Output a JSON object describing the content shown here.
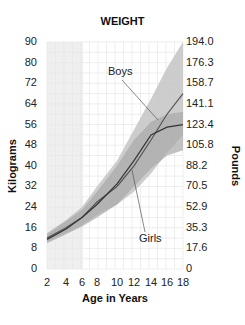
{
  "chart_data": {
    "type": "line",
    "title": "WEIGHT",
    "xlabel": "Age in Years",
    "ylabel": "Kilograms",
    "ylabel_right": "Pounds",
    "x": [
      2,
      4,
      6,
      8,
      10,
      12,
      14,
      16,
      18
    ],
    "x_tick_labels": [
      "2",
      "4",
      "6",
      "8",
      "10",
      "12",
      "14",
      "16",
      "18"
    ],
    "y_tick_labels": [
      "90",
      "80",
      "72",
      "64",
      "56",
      "48",
      "40",
      "32",
      "24",
      "16",
      "8",
      "0"
    ],
    "y_right_tick_labels": [
      "194.0",
      "176.3",
      "158.7",
      "141.1",
      "123.4",
      "105.8",
      "88.2",
      "70.5",
      "52.9",
      "35.3",
      "17.6",
      "0"
    ],
    "ylim": [
      0,
      90
    ],
    "xlim": [
      2,
      18
    ],
    "grid": true,
    "series": [
      {
        "name": "Boys",
        "values": [
          12,
          16,
          20,
          26,
          32,
          40,
          50,
          60,
          68
        ],
        "band_low": [
          10.5,
          14,
          17,
          21,
          25,
          30,
          37,
          45,
          52
        ],
        "band_high": [
          14,
          19,
          24,
          32,
          42,
          54,
          66,
          78,
          90
        ]
      },
      {
        "name": "Girls",
        "values": [
          11.5,
          15.5,
          20,
          25,
          33,
          42,
          52,
          55,
          56
        ],
        "band_low": [
          10,
          13.5,
          16.5,
          20,
          25,
          32,
          39,
          44,
          46
        ],
        "band_high": [
          13.5,
          18.5,
          23,
          30,
          40,
          50,
          57,
          60,
          61
        ]
      }
    ],
    "annotations": [
      "Boys",
      "Girls"
    ],
    "shaded_region": {
      "x_from": 2,
      "x_to": 6
    }
  },
  "title": "WEIGHT",
  "xlabel": "Age in Years",
  "ylabel_left": "Kilograms",
  "ylabel_right": "Pounds",
  "annotations": {
    "boys": "Boys",
    "girls": "Girls"
  }
}
